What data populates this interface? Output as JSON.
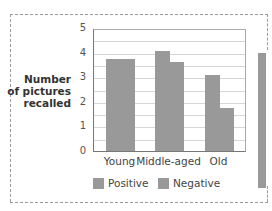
{
  "chart_data": {
    "type": "bar",
    "title": "",
    "xlabel": "",
    "ylabel": "Number of pictures recalled",
    "ylabel_lines": [
      "Number",
      "of pictures",
      "recalled"
    ],
    "categories": [
      "Young",
      "Middle-aged",
      "Old"
    ],
    "series": [
      {
        "name": "Positive",
        "color": "#999999",
        "values": [
          3.75,
          4.05,
          3.1
        ]
      },
      {
        "name": "Negative",
        "color": "#999999",
        "values": [
          3.75,
          3.6,
          1.75
        ]
      }
    ],
    "ylim": [
      0,
      5
    ],
    "yticks": [
      0,
      1,
      2,
      3,
      4,
      5
    ],
    "grid": true,
    "grid_step": 0.5,
    "legend_position": "bottom"
  },
  "legend": {
    "positive": "Positive",
    "negative": "Negative"
  }
}
